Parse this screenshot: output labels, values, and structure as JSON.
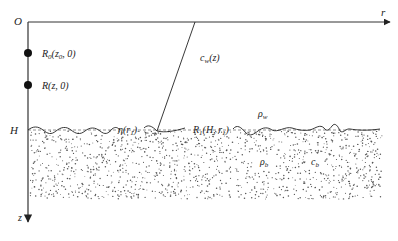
{
  "diagram": {
    "origin_label": "O",
    "r_axis_label": "r",
    "z_axis_label": "z",
    "depth_label": "H",
    "source_point": {
      "label": "R",
      "sub": "0",
      "args": "(z",
      "args_sub": "0",
      "args_tail": ", 0)"
    },
    "receiver_point": {
      "label": "R(z, 0)"
    },
    "sound_speed_label": {
      "main": "c",
      "sub": "w",
      "tail": "(z)"
    },
    "interface_label": {
      "main": "η(r",
      "sub": "1",
      "tail": ")"
    },
    "interface_point_label": {
      "main": "R",
      "sub": "1",
      "mid": "(H, r",
      "sub2": "1",
      "tail": ")"
    },
    "water_density_label": {
      "main": "ρ",
      "sub": "w"
    },
    "bottom_density_label": {
      "main": "ρ",
      "sub": "b"
    },
    "bottom_speed_label": {
      "main": "c",
      "sub": "b"
    },
    "colors": {
      "line": "#222222",
      "dots": "#555555",
      "axis": "#333333"
    }
  }
}
